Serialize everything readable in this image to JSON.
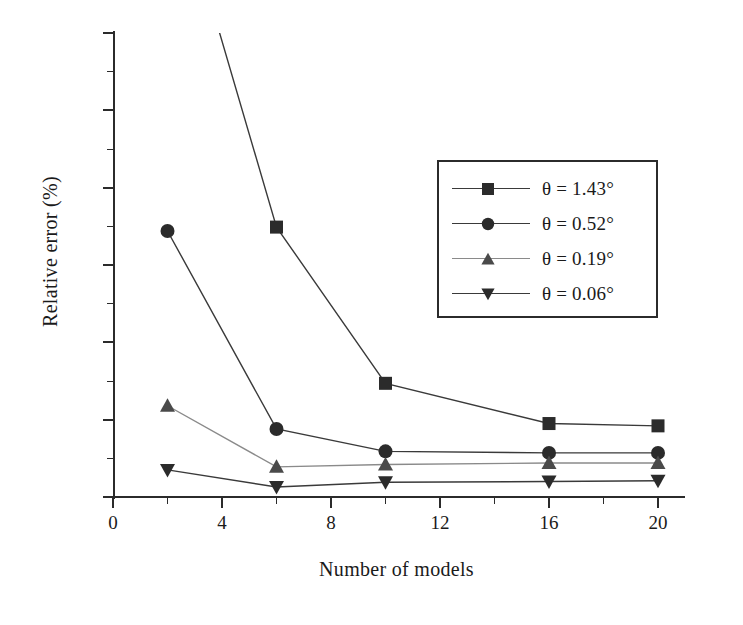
{
  "chart_data": {
    "type": "line",
    "title": "",
    "xlabel": "Number of models",
    "ylabel": "Relative error (%)",
    "xlim": [
      0,
      21
    ],
    "ylim": [
      0,
      30
    ],
    "xticks": [
      0,
      4,
      8,
      12,
      16,
      20
    ],
    "xtick_labels": [
      "0",
      "4",
      "8",
      "12",
      "16",
      "20"
    ],
    "xminor_ticks": [
      2,
      6,
      10,
      14,
      18
    ],
    "yticks": [
      0,
      5,
      10,
      15,
      20,
      25,
      30
    ],
    "ytick_labels": [
      "0",
      "5",
      "10",
      "15",
      "20",
      "25",
      "30"
    ],
    "yminor_ticks": [
      2.5,
      7.5,
      12.5,
      17.5,
      22.5,
      27.5
    ],
    "grid": false,
    "legend_position": "upper right",
    "x": [
      2,
      6,
      10,
      16,
      20
    ],
    "series": [
      {
        "name": "θ = 1.43°",
        "marker": "square",
        "color": "#2b2b2b",
        "values": [
          41.5,
          17.45,
          7.35,
          4.75,
          4.6
        ],
        "clipped_above_axis": true,
        "note": "first point at x=2 lies above the 30% axis limit"
      },
      {
        "name": "θ = 0.52°",
        "marker": "circle",
        "color": "#2b2b2b",
        "values": [
          17.2,
          4.4,
          2.95,
          2.85,
          2.85
        ],
        "clipped_above_axis": false,
        "note": ""
      },
      {
        "name": "θ = 0.19°",
        "marker": "triangle-up",
        "color": "#4a4a4a",
        "values": [
          5.9,
          1.95,
          2.1,
          2.2,
          2.2
        ],
        "clipped_above_axis": false,
        "note": ""
      },
      {
        "name": "θ = 0.06°",
        "marker": "triangle-down",
        "color": "#2b2b2b",
        "values": [
          1.75,
          0.65,
          0.95,
          1.0,
          1.05
        ],
        "clipped_above_axis": false,
        "note": ""
      }
    ]
  },
  "legend": {
    "entries": [
      {
        "label": "θ = 1.43°",
        "marker": "square-marker-icon"
      },
      {
        "label": "θ = 0.52°",
        "marker": "circle-marker-icon"
      },
      {
        "label": "θ = 0.19°",
        "marker": "triangle-up-marker-icon"
      },
      {
        "label": "θ = 0.06°",
        "marker": "triangle-down-marker-icon"
      }
    ]
  },
  "colors": {
    "axis": "#2b2b2b",
    "line": "#3a3a3a",
    "marker_dark": "#2b2b2b",
    "marker_gray": "#4a4a4a",
    "background": "#ffffff"
  }
}
